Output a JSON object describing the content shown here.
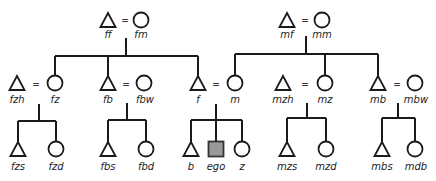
{
  "diagram": {
    "type": "kinship-chart",
    "legend_symbols": {
      "triangle": "male",
      "circle": "female",
      "square-filled": "ego",
      "equals": "marriage"
    },
    "colors": {
      "line": "#1a1a1a",
      "ego_fill": "#9a9a9a"
    },
    "nodes": {
      "ff": {
        "label": "ff",
        "shape": "triangle"
      },
      "fm": {
        "label": "fm",
        "shape": "circle"
      },
      "mf": {
        "label": "mf",
        "shape": "triangle"
      },
      "mm": {
        "label": "mm",
        "shape": "circle"
      },
      "fzh": {
        "label": "fzh",
        "shape": "triangle"
      },
      "fz": {
        "label": "fz",
        "shape": "circle"
      },
      "fb": {
        "label": "fb",
        "shape": "triangle"
      },
      "fbw": {
        "label": "fbw",
        "shape": "circle"
      },
      "f": {
        "label": "f",
        "shape": "triangle"
      },
      "m": {
        "label": "m",
        "shape": "circle"
      },
      "mzh": {
        "label": "mzh",
        "shape": "triangle"
      },
      "mz": {
        "label": "mz",
        "shape": "circle"
      },
      "mb": {
        "label": "mb",
        "shape": "triangle"
      },
      "mbw": {
        "label": "mbw",
        "shape": "circle"
      },
      "fzs": {
        "label": "fzs",
        "shape": "triangle"
      },
      "fzd": {
        "label": "fzd",
        "shape": "circle"
      },
      "fbs": {
        "label": "fbs",
        "shape": "triangle"
      },
      "fbd": {
        "label": "fbd",
        "shape": "circle"
      },
      "b": {
        "label": "b",
        "shape": "triangle"
      },
      "ego": {
        "label": "ego",
        "shape": "square"
      },
      "z": {
        "label": "z",
        "shape": "circle"
      },
      "mzs": {
        "label": "mzs",
        "shape": "triangle"
      },
      "mzd": {
        "label": "mzd",
        "shape": "circle"
      },
      "mbs": {
        "label": "mbs",
        "shape": "triangle"
      },
      "mdb": {
        "label": "mdb",
        "shape": "circle"
      }
    },
    "marriage_sign": "=",
    "marriages": [
      [
        "ff",
        "fm"
      ],
      [
        "mf",
        "mm"
      ],
      [
        "fzh",
        "fz"
      ],
      [
        "fb",
        "fbw"
      ],
      [
        "f",
        "m"
      ],
      [
        "mzh",
        "mz"
      ],
      [
        "mb",
        "mbw"
      ]
    ],
    "sibling_groups": [
      {
        "parents": [
          "ff",
          "fm"
        ],
        "children": [
          "fz",
          "fb",
          "f"
        ]
      },
      {
        "parents": [
          "mf",
          "mm"
        ],
        "children": [
          "m",
          "mz",
          "mb"
        ]
      },
      {
        "parents": [
          "fzh",
          "fz"
        ],
        "children": [
          "fzs",
          "fzd"
        ]
      },
      {
        "parents": [
          "fb",
          "fbw"
        ],
        "children": [
          "fbs",
          "fbd"
        ]
      },
      {
        "parents": [
          "f",
          "m"
        ],
        "children": [
          "b",
          "ego",
          "z"
        ]
      },
      {
        "parents": [
          "mzh",
          "mz"
        ],
        "children": [
          "mzs",
          "mzd"
        ]
      },
      {
        "parents": [
          "mb",
          "mbw"
        ],
        "children": [
          "mbs",
          "mdb"
        ]
      }
    ]
  }
}
